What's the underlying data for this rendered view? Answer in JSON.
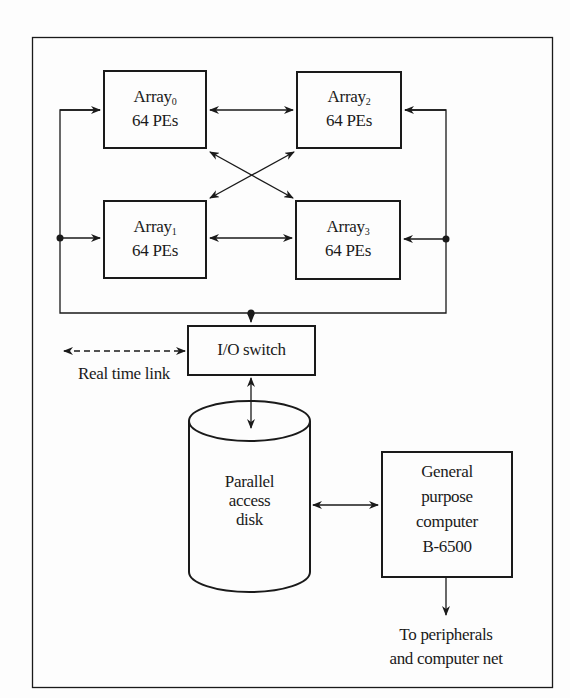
{
  "diagram": {
    "arrays": [
      {
        "name": "Array",
        "index": "0",
        "pes": "64 PEs"
      },
      {
        "name": "Array",
        "index": "1",
        "pes": "64 PEs"
      },
      {
        "name": "Array",
        "index": "2",
        "pes": "64 PEs"
      },
      {
        "name": "Array",
        "index": "3",
        "pes": "64 PEs"
      }
    ],
    "io_switch": "I/O switch",
    "real_time_link": "Real time link",
    "disk": {
      "line1": "Parallel",
      "line2": "access",
      "line3": "disk"
    },
    "computer": {
      "line1": "General",
      "line2": "purpose",
      "line3": "computer",
      "line4": "B-6500"
    },
    "output": {
      "line1": "To peripherals",
      "line2": "and computer net"
    },
    "colors": {
      "stroke": "#1a1a1a",
      "background": "#fdfdfd"
    }
  }
}
